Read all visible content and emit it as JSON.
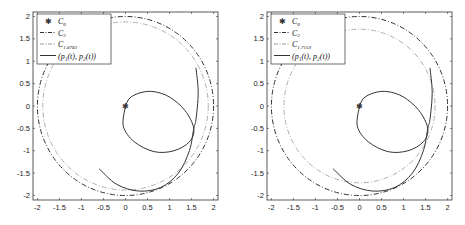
{
  "chart_data": [
    {
      "type": "line",
      "title": "",
      "xlabel": "",
      "ylabel": "",
      "xlim": [
        -2.1,
        2.1
      ],
      "ylim": [
        -2.1,
        2.1
      ],
      "grid": false,
      "legend_position": "upper-left",
      "xticks": [
        "-2",
        "-1.5",
        "-1",
        "-0.5",
        "0",
        "0.5",
        "1",
        "1.5",
        "2"
      ],
      "yticks": [
        "2",
        "1.5",
        "1",
        "0.5",
        "0",
        "-0.5",
        "-1",
        "-1.5",
        "-2"
      ],
      "legend": [
        {
          "label": "C_0",
          "style": "marker-star"
        },
        {
          "label": "C_2",
          "style": "dash-dot-dark"
        },
        {
          "label": "C_1.8783",
          "style": "dash-dot-light"
        },
        {
          "label": "(p_1(t), p_2(t))",
          "style": "solid"
        }
      ],
      "series": [
        {
          "name": "C_0",
          "points": [
            [
              0,
              0
            ]
          ]
        },
        {
          "name": "C_2",
          "shape": "circle",
          "center": [
            0,
            0
          ],
          "radius": 2
        },
        {
          "name": "C_1.8783",
          "shape": "circle",
          "center": [
            0,
            0
          ],
          "radius": 1.8783
        },
        {
          "name": "(p_1(t), p_2(t))",
          "points": [
            [
              0,
              0
            ],
            [
              0.1,
              0.18
            ],
            [
              0.35,
              0.3
            ],
            [
              0.65,
              0.32
            ],
            [
              1.0,
              0.2
            ],
            [
              1.35,
              -0.1
            ],
            [
              1.55,
              -0.5
            ],
            [
              1.45,
              -0.8
            ],
            [
              1.1,
              -1.0
            ],
            [
              0.65,
              -1.02
            ],
            [
              0.2,
              -0.8
            ],
            [
              -0.05,
              -0.45
            ],
            [
              0,
              0
            ]
          ]
        },
        {
          "name": "(p_1(t), p_2(t)) branch",
          "points": [
            [
              1.6,
              0.85
            ],
            [
              1.65,
              0.3
            ],
            [
              1.6,
              -0.3
            ],
            [
              1.55,
              -0.5
            ],
            [
              1.45,
              -1.0
            ],
            [
              1.2,
              -1.5
            ],
            [
              0.8,
              -1.82
            ],
            [
              0.3,
              -1.9
            ],
            [
              -0.2,
              -1.75
            ],
            [
              -0.6,
              -1.4
            ]
          ]
        }
      ]
    },
    {
      "type": "line",
      "title": "",
      "xlabel": "",
      "ylabel": "",
      "xlim": [
        -2.1,
        2.1
      ],
      "ylim": [
        -2.1,
        2.1
      ],
      "grid": false,
      "legend_position": "upper-left",
      "xticks": [
        "-2",
        "-1.5",
        "-1",
        "-0.5",
        "0",
        "0.5",
        "1",
        "1.5",
        "2"
      ],
      "yticks": [
        "2",
        "1.5",
        "1",
        "0.5",
        "0",
        "-0.5",
        "-1",
        "-1.5",
        "-2"
      ],
      "legend": [
        {
          "label": "C_0",
          "style": "marker-star"
        },
        {
          "label": "C_2",
          "style": "dash-dot-dark"
        },
        {
          "label": "C_1.7159",
          "style": "dash-dot-light"
        },
        {
          "label": "(p_1(t), p_2(t))",
          "style": "solid"
        }
      ],
      "series": [
        {
          "name": "C_0",
          "points": [
            [
              0,
              0
            ]
          ]
        },
        {
          "name": "C_2",
          "shape": "circle",
          "center": [
            0,
            0
          ],
          "radius": 2
        },
        {
          "name": "C_1.7159",
          "shape": "circle",
          "center": [
            0,
            0
          ],
          "radius": 1.7159
        },
        {
          "name": "(p_1(t), p_2(t))",
          "points": [
            [
              0,
              0
            ],
            [
              0.1,
              0.18
            ],
            [
              0.35,
              0.3
            ],
            [
              0.65,
              0.32
            ],
            [
              1.0,
              0.2
            ],
            [
              1.35,
              -0.1
            ],
            [
              1.55,
              -0.5
            ],
            [
              1.45,
              -0.8
            ],
            [
              1.1,
              -1.0
            ],
            [
              0.65,
              -1.02
            ],
            [
              0.2,
              -0.8
            ],
            [
              -0.05,
              -0.45
            ],
            [
              0,
              0
            ]
          ]
        },
        {
          "name": "(p_1(t), p_2(t)) branch",
          "points": [
            [
              1.6,
              0.85
            ],
            [
              1.65,
              0.3
            ],
            [
              1.6,
              -0.3
            ],
            [
              1.55,
              -0.5
            ],
            [
              1.45,
              -1.0
            ],
            [
              1.2,
              -1.5
            ],
            [
              0.8,
              -1.82
            ],
            [
              0.3,
              -1.9
            ],
            [
              -0.2,
              -1.75
            ],
            [
              -0.6,
              -1.4
            ]
          ]
        }
      ]
    }
  ],
  "panels": [
    {
      "legend": {
        "c0": "C",
        "c0_sub": "0",
        "c2": "C",
        "c2_sub": "2",
        "cr": "C",
        "cr_sub": "1.8783",
        "traj": "(p₁(t), p₂(t))"
      }
    },
    {
      "legend": {
        "c0": "C",
        "c0_sub": "0",
        "c2": "C",
        "c2_sub": "2",
        "cr": "C",
        "cr_sub": "1.7159",
        "traj": "(p₁(t), p₂(t))"
      }
    }
  ],
  "colors": {
    "dark": "#333333",
    "light": "#9a9a9a",
    "frame": "#333333"
  }
}
